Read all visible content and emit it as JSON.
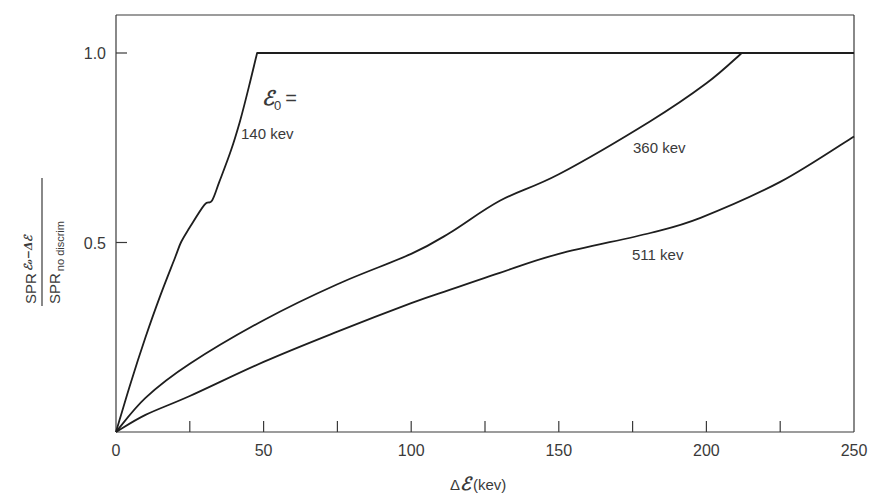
{
  "chart_data": {
    "type": "line",
    "title": "",
    "xlabel": "ΔE (kev)",
    "xlabel_parts": {
      "prefix": "Δ",
      "symbol": "ℰ",
      "suffix": "(kev)"
    },
    "ylabel": "SPR_{E0-ΔE} / SPR_{no discrim}",
    "ylabel_parts": {
      "numerator": "SPR",
      "numerator_sub": "ℰ₀−Δℰ",
      "denominator": "SPR",
      "denominator_sub": "no discrim"
    },
    "xlim": [
      0,
      250
    ],
    "ylim": [
      0,
      1.0
    ],
    "grid": false,
    "x_ticks_major": [
      0,
      50,
      100,
      150,
      200,
      250
    ],
    "x_ticks_minor": [
      25,
      75,
      125,
      175,
      225
    ],
    "x_tick_labels": [
      "0",
      "50",
      "100",
      "150",
      "200",
      "250"
    ],
    "y_ticks": [
      0.5,
      1.0
    ],
    "y_tick_labels": [
      "0.5",
      "1.0"
    ],
    "legend_header": "ℰ₀ =",
    "legend_header_parts": {
      "symbol": "ℰ",
      "sub": "0",
      "eq": "="
    },
    "series": [
      {
        "name": "140 kev",
        "label": "140 kev",
        "x": [
          0,
          5,
          10,
          15,
          20,
          22,
          25,
          30,
          32.5,
          35,
          39,
          42,
          45,
          47.8,
          100,
          150,
          200,
          250
        ],
        "y": [
          0,
          0.13,
          0.25,
          0.36,
          0.46,
          0.5,
          0.54,
          0.6,
          0.61,
          0.66,
          0.744,
          0.82,
          0.91,
          1.0,
          1.0,
          1.0,
          1.0,
          1.0
        ]
      },
      {
        "name": "360 kev",
        "label": "360 kev",
        "x": [
          0,
          10,
          25,
          50,
          75,
          100,
          113,
          130,
          150,
          181,
          200,
          212,
          250
        ],
        "y": [
          0,
          0.09,
          0.18,
          0.295,
          0.39,
          0.47,
          0.525,
          0.61,
          0.68,
          0.82,
          0.92,
          1.0,
          1.0
        ]
      },
      {
        "name": "511 kev",
        "label": "511 kev",
        "x": [
          0,
          10,
          25,
          50,
          75,
          100,
          113,
          130,
          150,
          181,
          198,
          225,
          250
        ],
        "y": [
          0,
          0.045,
          0.095,
          0.185,
          0.265,
          0.34,
          0.375,
          0.42,
          0.47,
          0.525,
          0.565,
          0.66,
          0.78
        ]
      }
    ],
    "annotations": [
      {
        "text": "ℰ₀ =",
        "x": 47,
        "y": 0.84
      },
      {
        "text": "140 kev",
        "x": 42,
        "y": 0.76
      },
      {
        "text": "360 kev",
        "x": 175,
        "y": 0.72
      },
      {
        "text": "511 kev",
        "x": 168,
        "y": 0.48
      }
    ]
  }
}
